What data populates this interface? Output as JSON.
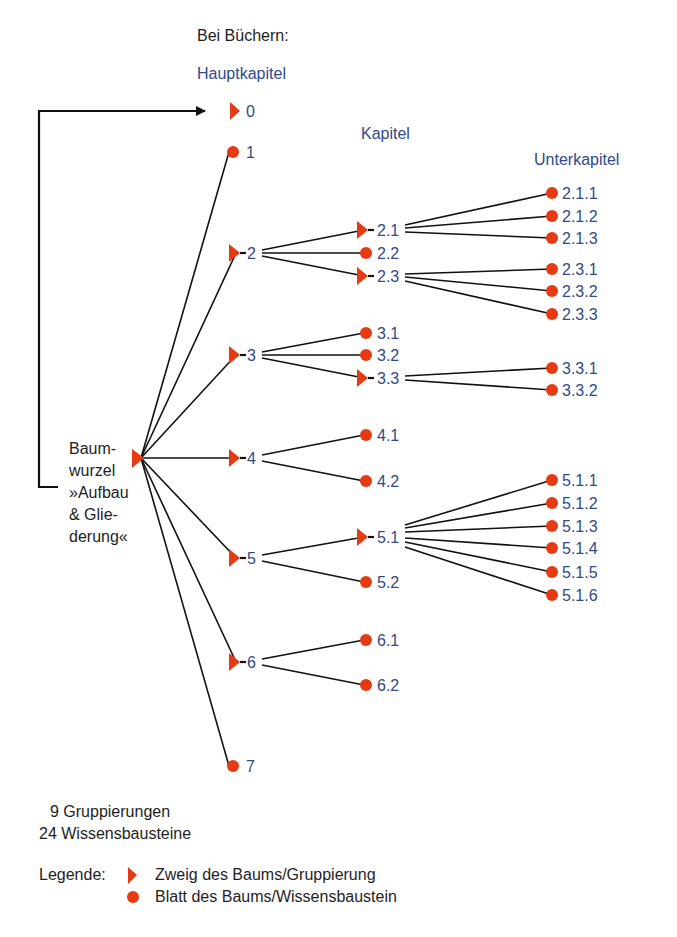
{
  "header": {
    "context": "Bei Büchern:",
    "level_labels": {
      "main": "Hauptkapitel",
      "chapter": "Kapitel",
      "sub": "Unterkapitel"
    }
  },
  "root": {
    "lines": [
      "Baum-",
      "wurzel",
      "»Aufbau",
      "& Glie-",
      "derung«"
    ],
    "type": "branch"
  },
  "colors": {
    "node": "#e53a12",
    "label": "#2f4a8a",
    "edge": "#111111",
    "text": "#1e1e1e"
  },
  "nodes": {
    "n0": {
      "label": "0",
      "type": "branch"
    },
    "n1": {
      "label": "1",
      "type": "leaf"
    },
    "n2": {
      "label": "2",
      "type": "branch"
    },
    "n3": {
      "label": "3",
      "type": "branch"
    },
    "n4": {
      "label": "4",
      "type": "branch"
    },
    "n5": {
      "label": "5",
      "type": "branch"
    },
    "n6": {
      "label": "6",
      "type": "branch"
    },
    "n7": {
      "label": "7",
      "type": "leaf"
    },
    "n2_1": {
      "label": "2.1",
      "type": "branch"
    },
    "n2_2": {
      "label": "2.2",
      "type": "leaf"
    },
    "n2_3": {
      "label": "2.3",
      "type": "branch"
    },
    "n3_1": {
      "label": "3.1",
      "type": "leaf"
    },
    "n3_2": {
      "label": "3.2",
      "type": "leaf"
    },
    "n3_3": {
      "label": "3.3",
      "type": "branch"
    },
    "n4_1": {
      "label": "4.1",
      "type": "leaf"
    },
    "n4_2": {
      "label": "4.2",
      "type": "leaf"
    },
    "n5_1": {
      "label": "5.1",
      "type": "branch"
    },
    "n5_2": {
      "label": "5.2",
      "type": "leaf"
    },
    "n6_1": {
      "label": "6.1",
      "type": "leaf"
    },
    "n6_2": {
      "label": "6.2",
      "type": "leaf"
    },
    "n2_1_1": {
      "label": "2.1.1",
      "type": "leaf"
    },
    "n2_1_2": {
      "label": "2.1.2",
      "type": "leaf"
    },
    "n2_1_3": {
      "label": "2.1.3",
      "type": "leaf"
    },
    "n2_3_1": {
      "label": "2.3.1",
      "type": "leaf"
    },
    "n2_3_2": {
      "label": "2.3.2",
      "type": "leaf"
    },
    "n2_3_3": {
      "label": "2.3.3",
      "type": "leaf"
    },
    "n3_3_1": {
      "label": "3.3.1",
      "type": "leaf"
    },
    "n3_3_2": {
      "label": "3.3.2",
      "type": "leaf"
    },
    "n5_1_1": {
      "label": "5.1.1",
      "type": "leaf"
    },
    "n5_1_2": {
      "label": "5.1.2",
      "type": "leaf"
    },
    "n5_1_3": {
      "label": "5.1.3",
      "type": "leaf"
    },
    "n5_1_4": {
      "label": "5.1.4",
      "type": "leaf"
    },
    "n5_1_5": {
      "label": "5.1.5",
      "type": "leaf"
    },
    "n5_1_6": {
      "label": "5.1.6",
      "type": "leaf"
    }
  },
  "summary": {
    "groupings": "9 Gruppierungen",
    "modules": "24 Wissensbausteine"
  },
  "legend": {
    "title": "Legende:",
    "branch": "Zweig des Baums/Gruppierung",
    "leaf": "Blatt des Baums/Wissensbaustein"
  }
}
